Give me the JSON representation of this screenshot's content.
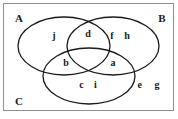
{
  "figure": {
    "type": "venn-diagram-3-set",
    "background_color": "#ffffff",
    "stroke_color": "#1a1a1a",
    "frame_color": "#8f8f8f",
    "text_color": "#1a1a1a"
  },
  "sets": {
    "a": {
      "label": "A",
      "x": 19,
      "y": 18
    },
    "b": {
      "label": "B",
      "x": 162,
      "y": 18
    },
    "c": {
      "label": "C",
      "x": 19,
      "y": 101
    }
  },
  "regions": {
    "a_only": {
      "name": "A only",
      "elements": "j",
      "x": 54,
      "y": 36
    },
    "b_only": {
      "name": "B only",
      "elements": "f h",
      "x": 122,
      "y": 36
    },
    "c_only": {
      "name": "C only",
      "elements": "c i",
      "x": 90,
      "y": 85
    },
    "a_and_b": {
      "name": "A intersect B",
      "elements": "d",
      "x": 88,
      "y": 34
    },
    "a_and_c": {
      "name": "A intersect C",
      "elements": "b",
      "x": 66,
      "y": 63
    },
    "b_and_c": {
      "name": "B intersect C",
      "elements": "a",
      "x": 113,
      "y": 63
    },
    "a_and_b_and_c": {
      "name": "A intersect B intersect C",
      "elements": "",
      "x": 89,
      "y": 57
    },
    "outside": {
      "name": "Outside all sets",
      "elements": "e g",
      "x": 151,
      "y": 85
    }
  },
  "elements_list": [
    "a",
    "b",
    "c",
    "d",
    "e",
    "f",
    "g",
    "h",
    "i",
    "j"
  ]
}
